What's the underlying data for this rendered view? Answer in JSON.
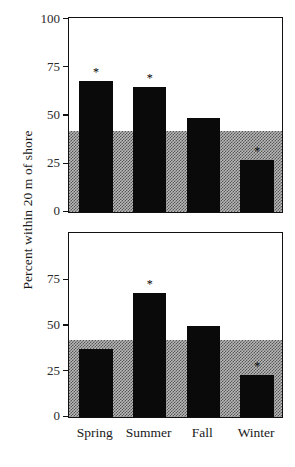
{
  "chart_data": {
    "type": "bar",
    "title": "",
    "xlabel": "",
    "ylabel": "Percent within 20 m of shore",
    "categories": [
      "Spring",
      "Summer",
      "Fall",
      "Winter"
    ],
    "ylim": [
      0,
      100
    ],
    "grid": false,
    "legend": "none",
    "panels": [
      {
        "name": "top-panel",
        "ylim": [
          0,
          100
        ],
        "yticks": [
          0,
          25,
          50,
          75,
          100
        ],
        "ytick_labels": [
          "0",
          "25",
          "50",
          "75",
          "100"
        ],
        "reference_band": {
          "label": "",
          "from": 0,
          "to": 42,
          "style": "checkered-gray",
          "color": "#b9b9b9"
        },
        "values": [
          68,
          65,
          49,
          27
        ],
        "annotations": [
          "*",
          "*",
          "",
          "*"
        ]
      },
      {
        "name": "bottom-panel",
        "ylim": [
          0,
          100
        ],
        "yticks": [
          0,
          25,
          50,
          75
        ],
        "ytick_labels": [
          "0",
          "25",
          "50",
          "75"
        ],
        "reference_band": {
          "label": "",
          "from": 0,
          "to": 42,
          "style": "checkered-gray",
          "color": "#b9b9b9"
        },
        "values": [
          37,
          68,
          50,
          23
        ],
        "annotations": [
          "",
          "*",
          "",
          "*"
        ]
      }
    ],
    "bar_color": "#0a0a0a",
    "axis_color": "#111111"
  }
}
